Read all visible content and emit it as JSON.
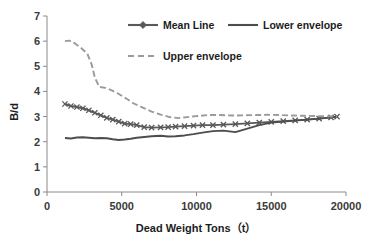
{
  "chart_data": {
    "type": "line",
    "title": "",
    "xlabel": "Dead Weight Tons（t）",
    "ylabel": "B/d",
    "xlim": [
      0,
      20000
    ],
    "ylim": [
      0,
      7
    ],
    "xticks": [
      "0",
      "5000",
      "10000",
      "15000",
      "20000"
    ],
    "xtick_values": [
      0,
      5000,
      10000,
      15000,
      20000
    ],
    "yticks": [
      "0",
      "1",
      "2",
      "3",
      "4",
      "5",
      "6",
      "7"
    ],
    "ytick_values": [
      0,
      1,
      2,
      3,
      4,
      5,
      6,
      7
    ],
    "grid": false,
    "legend_position": "top-center",
    "series": [
      {
        "name": "Mean Line",
        "style": "solid-with-diamond-marker",
        "color": "#595959",
        "marker": "x",
        "x": [
          1200,
          1600,
          2000,
          2400,
          2800,
          3200,
          3600,
          4000,
          4400,
          4800,
          5200,
          5600,
          6000,
          6500,
          7000,
          7600,
          8100,
          8600,
          9200,
          9800,
          10400,
          11100,
          11800,
          12600,
          13400,
          14200,
          15000,
          15800,
          16600,
          17400,
          18200,
          19000,
          19400
        ],
        "y": [
          3.5,
          3.42,
          3.38,
          3.33,
          3.25,
          3.15,
          3.05,
          2.95,
          2.88,
          2.8,
          2.72,
          2.7,
          2.66,
          2.58,
          2.56,
          2.57,
          2.58,
          2.6,
          2.62,
          2.64,
          2.66,
          2.66,
          2.68,
          2.7,
          2.73,
          2.76,
          2.79,
          2.82,
          2.85,
          2.88,
          2.92,
          2.97,
          3.0
        ]
      },
      {
        "name": "Lower envelope",
        "style": "solid",
        "color": "#4d4d4d",
        "marker": "none",
        "x": [
          1200,
          1600,
          2000,
          2400,
          2800,
          3200,
          3600,
          4000,
          4400,
          4800,
          5200,
          5600,
          6000,
          6500,
          7000,
          7600,
          8100,
          8600,
          9200,
          9800,
          10400,
          11100,
          11800,
          12600,
          13400,
          14200,
          15000,
          15800,
          16600,
          17400,
          18200,
          19000,
          19400
        ],
        "y": [
          2.15,
          2.13,
          2.17,
          2.18,
          2.16,
          2.14,
          2.15,
          2.14,
          2.1,
          2.07,
          2.09,
          2.12,
          2.16,
          2.19,
          2.22,
          2.24,
          2.21,
          2.22,
          2.25,
          2.3,
          2.36,
          2.42,
          2.44,
          2.38,
          2.52,
          2.66,
          2.76,
          2.8,
          2.84,
          2.88,
          2.92,
          2.97,
          3.0
        ]
      },
      {
        "name": "Upper envelope",
        "style": "dashed",
        "color": "#9a9a9a",
        "marker": "none",
        "x": [
          1200,
          1500,
          1900,
          2300,
          2700,
          3000,
          3200,
          3500,
          3900,
          4300,
          4800,
          5300,
          5800,
          6400,
          7000,
          7600,
          8200,
          8800,
          9400,
          10000,
          10800,
          11600,
          12400,
          13200,
          14000,
          14800,
          15600,
          16400,
          17200,
          18000,
          18700,
          19400
        ],
        "y": [
          6.0,
          6.02,
          5.9,
          5.72,
          5.5,
          5.05,
          4.55,
          4.18,
          4.14,
          4.05,
          3.9,
          3.72,
          3.52,
          3.36,
          3.2,
          3.08,
          2.98,
          2.94,
          2.98,
          3.02,
          3.06,
          3.06,
          3.04,
          3.05,
          3.06,
          3.07,
          3.06,
          3.04,
          3.03,
          3.02,
          3.01,
          3.0
        ]
      }
    ],
    "legend": [
      {
        "label": "Mean Line",
        "style": "solid-with-diamond-marker",
        "color": "#595959"
      },
      {
        "label": "Lower envelope",
        "style": "solid",
        "color": "#4d4d4d"
      },
      {
        "label": "Upper envelope",
        "style": "dashed",
        "color": "#9a9a9a"
      }
    ]
  }
}
